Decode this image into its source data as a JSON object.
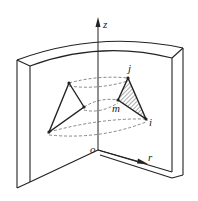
{
  "diagram": {
    "type": "axisymmetric-element-geometry",
    "axes": {
      "z_label": "z",
      "r_label": "r",
      "origin_label": "o"
    },
    "nodes": {
      "i_label": "i",
      "j_label": "j",
      "m_label": "m"
    },
    "colors": {
      "stroke": "#222222",
      "hatch": "#333333",
      "dashed": "#555555",
      "background": "#ffffff"
    }
  }
}
